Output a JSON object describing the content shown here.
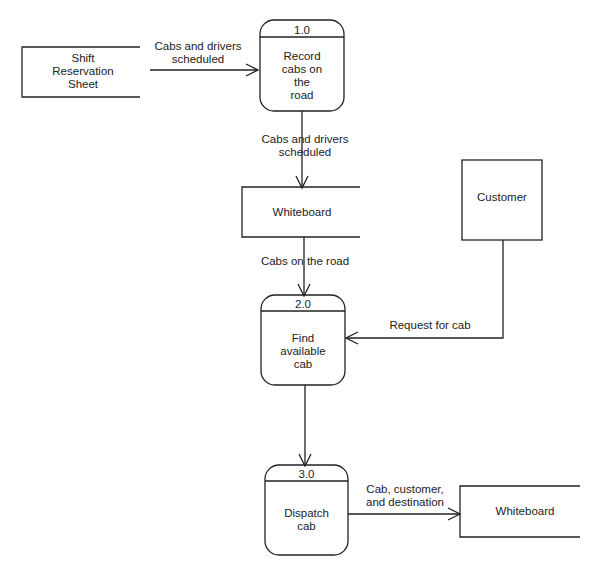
{
  "external_entities": [
    {
      "label": "Customer"
    }
  ],
  "data_stores": [
    {
      "label_lines": [
        "Shift",
        "Reservation",
        "Sheet"
      ]
    },
    {
      "label": "Whiteboard"
    },
    {
      "label": "Whiteboard"
    }
  ],
  "processes": [
    {
      "id": "1.0",
      "label_lines": [
        "Record",
        "cabs on",
        "the",
        "road"
      ]
    },
    {
      "id": "2.0",
      "label_lines": [
        "Find",
        "available",
        "cab"
      ]
    },
    {
      "id": "3.0",
      "label_lines": [
        "Dispatch",
        "cab"
      ]
    }
  ],
  "flows": [
    {
      "label_lines": [
        "Cabs and drivers",
        "scheduled"
      ]
    },
    {
      "label_lines": [
        "Cabs and drivers",
        "scheduled"
      ]
    },
    {
      "label": "Cabs on the road"
    },
    {
      "label": "Request for cab"
    },
    {
      "label_lines": [
        "Cab, customer,",
        "and destination"
      ]
    }
  ],
  "colors": {
    "line": "#222222",
    "background": "#ffffff"
  }
}
